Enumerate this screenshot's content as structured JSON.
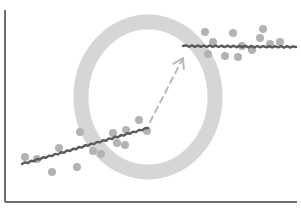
{
  "diagram": {
    "colors": {
      "background": "#ffffff",
      "axis": "#6e6e6e",
      "ring": "#d6d6d6",
      "points": "#b3b3b3",
      "trend_line": "#5a5a5a",
      "arrow": "#b8b8b8"
    },
    "axes": {
      "origin": [
        5,
        202
      ],
      "y_top": 10,
      "x_right": 297
    },
    "ring": {
      "cx": 148,
      "cy": 97,
      "rx": 67,
      "ry": 75,
      "stroke_width": 15
    },
    "arrow": {
      "from": [
        150,
        122
      ],
      "to": [
        183,
        58
      ]
    },
    "segments": [
      {
        "name": "lower-trend",
        "line": {
          "from": [
            22,
            164
          ],
          "to": [
            148,
            128
          ]
        },
        "points": [
          [
            25,
            157
          ],
          [
            37,
            159
          ],
          [
            52,
            172
          ],
          [
            59,
            148
          ],
          [
            77,
            167
          ],
          [
            80,
            132
          ],
          [
            93,
            151
          ],
          [
            101,
            154
          ],
          [
            113,
            133
          ],
          [
            117,
            143
          ],
          [
            125,
            145
          ],
          [
            126,
            130
          ],
          [
            139,
            120
          ],
          [
            147,
            131
          ]
        ]
      },
      {
        "name": "upper-plateau",
        "line": {
          "from": [
            183,
            46
          ],
          "to": [
            296,
            47
          ]
        },
        "points": [
          [
            205,
            32
          ],
          [
            213,
            42
          ],
          [
            208,
            54
          ],
          [
            233,
            33
          ],
          [
            225,
            56
          ],
          [
            242,
            46
          ],
          [
            238,
            57
          ],
          [
            252,
            50
          ],
          [
            260,
            38
          ],
          [
            263,
            29
          ],
          [
            270,
            44
          ],
          [
            280,
            42
          ]
        ]
      }
    ]
  }
}
